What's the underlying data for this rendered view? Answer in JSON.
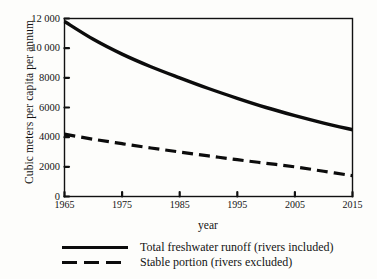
{
  "chart_data": {
    "type": "line",
    "title": "",
    "xlabel": "year",
    "ylabel": "Cubic meters per capita per annum",
    "xlim": [
      1965,
      2015
    ],
    "ylim": [
      0,
      12000
    ],
    "grid": false,
    "legend_position": "below-plot",
    "x_ticks": [
      "1965",
      "1975",
      "1985",
      "1995",
      "2005",
      "2015"
    ],
    "y_ticks": [
      "0",
      "2000",
      "4000",
      "6000",
      "8000",
      "10000",
      "12000"
    ],
    "y_tick_values": [
      0,
      2000,
      4000,
      6000,
      8000,
      10000,
      12000
    ],
    "x_tick_values": [
      1965,
      1975,
      1985,
      1995,
      2005,
      2015
    ],
    "x": [
      1965,
      1970,
      1975,
      1980,
      1985,
      1990,
      1995,
      2000,
      2005,
      2010,
      2015
    ],
    "series": [
      {
        "name": "Total freshwater runoff (rivers included)",
        "style": "solid",
        "color": "#0c0c0c",
        "values": [
          11800,
          10600,
          9600,
          8750,
          8000,
          7280,
          6620,
          6000,
          5450,
          4950,
          4500
        ]
      },
      {
        "name": "Stable portion (rivers excluded)",
        "style": "dashed",
        "color": "#0c0c0c",
        "values": [
          4200,
          3860,
          3560,
          3270,
          3000,
          2740,
          2480,
          2240,
          2000,
          1700,
          1400
        ]
      }
    ]
  },
  "legend": [
    {
      "label": "Total freshwater runoff (rivers included)",
      "style": "solid"
    },
    {
      "label": "Stable portion (rivers excluded)",
      "style": "dashed"
    }
  ],
  "axes": {
    "x_label": "year",
    "y_label": "Cubic meters per capita per annum"
  }
}
